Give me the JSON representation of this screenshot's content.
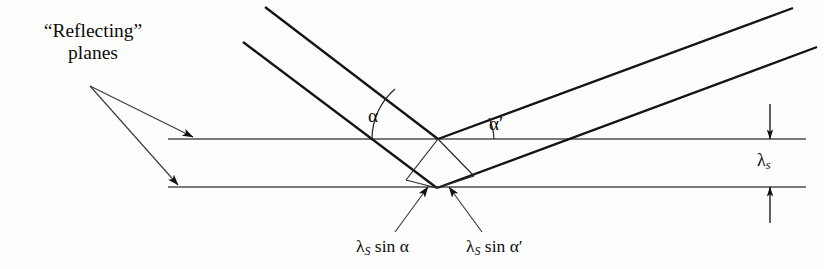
{
  "figure": {
    "kind": "physics-reflection-diagram",
    "background_color": "#fdfdfc",
    "ink_color": "#141414",
    "plane_color": "#4a4a4a"
  },
  "labels": {
    "reflecting_planes_line1": "“Reflecting”",
    "reflecting_planes_line2": "planes",
    "angle_incident": "α",
    "angle_reflected": "α′",
    "spacing_symbol": "λ",
    "spacing_subscript": "s",
    "path_left_lambda": "λ",
    "path_left_subscript": "S",
    "path_left_rest": " sin α",
    "path_right_lambda": "λ",
    "path_right_subscript": "S",
    "path_right_rest": " sin α′"
  },
  "geometry": {
    "plane_top_y": 139,
    "plane_bottom_y": 187,
    "plane_x_start": 168,
    "plane_x_end": 806,
    "vertex_top": [
      438,
      139
    ],
    "vertex_bottom": [
      437,
      188
    ],
    "incident_ray_outer_start": [
      265,
      7
    ],
    "incident_ray_inner_start": [
      243,
      42
    ],
    "reflected_ray_outer_end": [
      793,
      8
    ],
    "reflected_ray_inner_end": [
      817,
      47
    ],
    "arc_alpha_radius": 66,
    "arc_alpha_prime_radius": 56,
    "dimension_arrow_x": 770,
    "leader_origin": [
      90,
      86
    ],
    "leader_tip_top": [
      193,
      137
    ],
    "leader_tip_bottom": [
      178,
      185
    ],
    "path_arrow_left_tip": [
      428,
      187
    ],
    "path_arrow_right_tip": [
      449,
      187
    ]
  }
}
